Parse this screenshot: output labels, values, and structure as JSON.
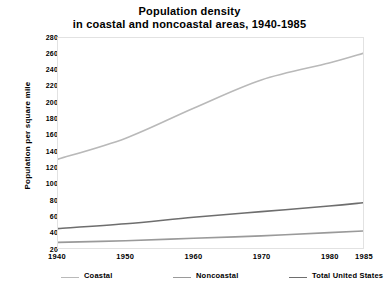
{
  "chart_data": {
    "type": "line",
    "title": "Population density in coastal and noncoastal areas, 1940-1985",
    "title_line1": "Population density",
    "title_line2": "in coastal and noncoastal areas, 1940-1985",
    "xlabel": "",
    "ylabel": "Population per square mile",
    "x": [
      1940,
      1950,
      1960,
      1970,
      1980,
      1985
    ],
    "xlim": [
      1940,
      1985
    ],
    "ylim": [
      20,
      280
    ],
    "xticks": [
      "1940",
      "1950",
      "1960",
      "1970",
      "1980",
      "1985"
    ],
    "yticks": [
      "20",
      "40",
      "60",
      "80",
      "100",
      "120",
      "140",
      "160",
      "180",
      "200",
      "220",
      "240",
      "260",
      "280"
    ],
    "grid": false,
    "legend_position": "below-axis",
    "series": [
      {
        "name": "Coastal",
        "color": "#b9b9b9",
        "values": [
          130,
          156,
          193,
          228,
          249,
          261
        ]
      },
      {
        "name": "Noncoastal",
        "color": "#9a9a9a",
        "values": [
          27,
          29,
          32,
          35,
          39,
          41
        ]
      },
      {
        "name": "Total United States",
        "color": "#6e6e6e",
        "values": [
          44,
          50,
          58,
          65,
          72,
          76
        ]
      }
    ]
  },
  "legend": {
    "items": [
      {
        "label": "Coastal"
      },
      {
        "label": "Noncoastal"
      },
      {
        "label": "Total United States"
      }
    ]
  },
  "colors": {
    "coastal": "#b9b9b9",
    "noncoastal": "#9a9a9a",
    "total": "#6e6e6e",
    "axis_frame": "#e2e2e2",
    "text": "#000000",
    "background": "#ffffff"
  }
}
